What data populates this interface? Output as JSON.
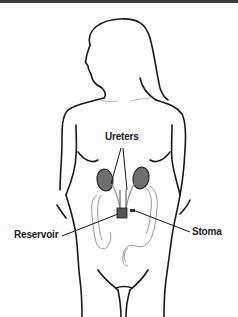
{
  "figure": {
    "labels": {
      "ureters": "Ureters",
      "reservoir": "Reservoir",
      "stoma": "Stoma"
    },
    "colors": {
      "outline": "#1a1a1a",
      "organ_fill": "#6e6e6e",
      "organ_light": "#cfcfcf",
      "background": "#fdfdfd",
      "top_border": "#3a3a3a"
    }
  }
}
